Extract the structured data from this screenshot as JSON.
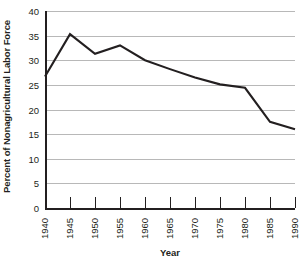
{
  "chart_data": {
    "type": "line",
    "title": "",
    "xlabel": "Year",
    "ylabel": "Percent of Nonagricultural Labor Force",
    "x": [
      1940,
      1945,
      1950,
      1955,
      1960,
      1965,
      1970,
      1975,
      1980,
      1985,
      1990
    ],
    "values": [
      26.7,
      35.3,
      31.3,
      33.0,
      30.0,
      28.2,
      26.5,
      25.1,
      24.4,
      17.5,
      16.0
    ],
    "series": [
      {
        "name": "Percent of Nonagricultural Labor Force",
        "values": [
          26.7,
          35.3,
          31.3,
          33.0,
          30.0,
          28.2,
          26.5,
          25.1,
          24.4,
          17.5,
          16.0
        ]
      }
    ],
    "xlim": [
      1940,
      1990
    ],
    "ylim": [
      0,
      40
    ],
    "ytick_labels": [
      "40",
      "35",
      "30",
      "25",
      "20",
      "15",
      "10",
      "5",
      "0"
    ],
    "ytick_values": [
      40,
      35,
      30,
      25,
      20,
      15,
      10,
      5,
      0
    ],
    "xtick_labels": [
      "1940",
      "1945",
      "1950",
      "1955",
      "1960",
      "1965",
      "1970",
      "1975",
      "1980",
      "1985",
      "1990"
    ],
    "grid": true,
    "grid_axis": "y",
    "legend": "none",
    "line_color": "#231f20",
    "grid_color": "#b8b8b8",
    "axis_color": "#231f20",
    "background_color": "#ffffff"
  }
}
